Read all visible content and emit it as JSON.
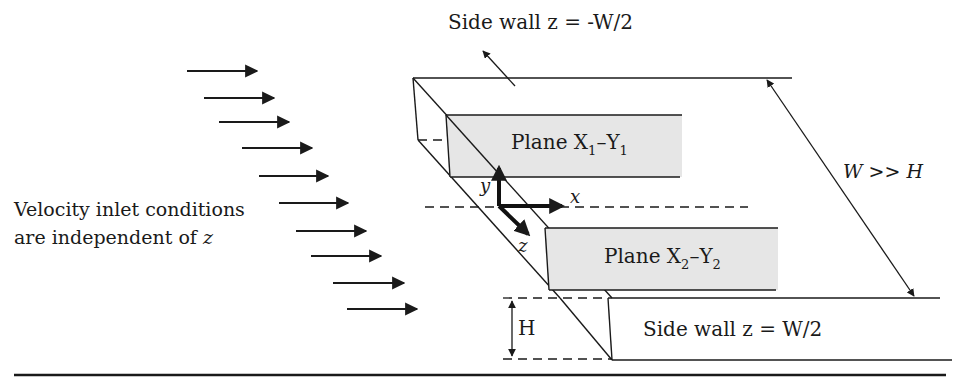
{
  "labels": {
    "side_wall_top": "Side wall z = -W/2",
    "side_wall_bottom": "Side wall z = W/2",
    "plane1": {
      "base": "Plane X",
      "sub1": "1",
      "mid": "–Y",
      "sub2": "1"
    },
    "plane2": {
      "base": "Plane X",
      "sub1": "2",
      "mid": "–Y",
      "sub2": "2"
    },
    "width_relation": "W >> H",
    "height": "H",
    "axis_x": "x",
    "axis_y": "y",
    "axis_z": "z",
    "inlet_line1": "Velocity inlet conditions",
    "inlet_line2_prefix": "are independent of ",
    "inlet_line2_var": "z"
  },
  "colors": {
    "stroke": "#1a1a1a",
    "plane_fill": "#e6e6e6",
    "background": "#ffffff"
  },
  "inlet_arrows": [
    {
      "x1": 187,
      "y1": 71,
      "x2": 257
    },
    {
      "x1": 204,
      "y1": 98,
      "x2": 274
    },
    {
      "x1": 219,
      "y1": 122,
      "x2": 289
    },
    {
      "x1": 242,
      "y1": 148,
      "x2": 312
    },
    {
      "x1": 259,
      "y1": 176,
      "x2": 328
    },
    {
      "x1": 279,
      "y1": 203,
      "x2": 348
    },
    {
      "x1": 296,
      "y1": 231,
      "x2": 366
    },
    {
      "x1": 311,
      "y1": 256,
      "x2": 381
    },
    {
      "x1": 333,
      "y1": 283,
      "x2": 404
    },
    {
      "x1": 347,
      "y1": 309,
      "x2": 417
    }
  ]
}
